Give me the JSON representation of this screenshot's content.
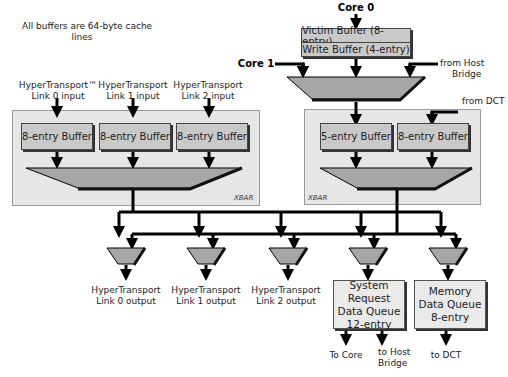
{
  "note": [
    "All buffers are 64-byte cache",
    "lines"
  ],
  "inputs": {
    "core0": "Core 0",
    "core1": "Core 1",
    "host_bridge": [
      "from Host",
      "Bridge"
    ],
    "dct": "from DCT",
    "ht_links": [
      [
        "HyperTransport™",
        "Link 0 input"
      ],
      [
        "HyperTransport",
        "Link 1  input"
      ],
      [
        "HyperTransport",
        "Link 2 input"
      ]
    ]
  },
  "core_buffers": [
    "Victim Buffer (8-entry)",
    "Write Buffer (4-entry)"
  ],
  "left_xbar": {
    "label": "XBAR",
    "buffers": [
      "8-entry Buffer",
      "8-entry Buffer",
      "8-entry Buffer"
    ]
  },
  "right_xbar": {
    "label": "XBAR",
    "buffers": [
      "5-entry Buffer",
      "8-entry Buffer"
    ]
  },
  "outputs": {
    "ht_links": [
      [
        "HyperTransport",
        "Link 0 output"
      ],
      [
        "HyperTransport",
        "Link 1  output"
      ],
      [
        "HyperTransport",
        "Link 2 output"
      ]
    ],
    "sri_queue": [
      "System",
      "Request",
      "Data Queue",
      "12-entry"
    ],
    "mem_queue": [
      "Memory",
      "Data Queue",
      "8-entry"
    ],
    "to_core": "To Core",
    "to_host_bridge": [
      "to Host",
      "Bridge"
    ],
    "to_dct": "to DCT"
  },
  "colors": {
    "mux": "#a6a6a6",
    "buffer": "#c9c9c9",
    "panel": "#e6e6e6",
    "line": "#000000"
  }
}
